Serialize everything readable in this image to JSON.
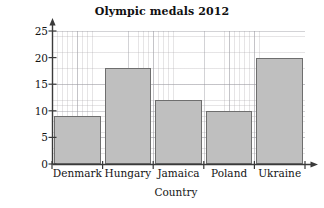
{
  "chart_data": {
    "type": "bar",
    "title": "Olympic medals 2012",
    "xlabel": "Country",
    "ylabel": "Number of medals",
    "categories": [
      "Denmark",
      "Hungary",
      "Jamaica",
      "Poland",
      "Ukraine"
    ],
    "values": [
      9,
      18,
      12,
      10,
      20
    ],
    "ylim": [
      0,
      25
    ],
    "yticks": [
      0,
      5,
      10,
      15,
      20,
      25
    ],
    "ytick_labels": [
      "0",
      "5",
      "10",
      "15",
      "20",
      "25"
    ],
    "grid": true,
    "legend": null,
    "colors": {
      "bar_fill": "#bfbfbf",
      "bar_border": "#6e6e6e",
      "axis": "#3a3a3a",
      "grid_major": "#96969e",
      "grid_minor": "#aca8ac",
      "background": "#ffffff",
      "text": "#141414"
    }
  }
}
